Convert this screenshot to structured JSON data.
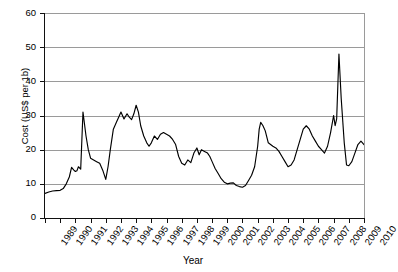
{
  "chart_data": {
    "type": "line",
    "title": "",
    "xlabel": "Year",
    "ylabel": "Cost (US$ per 1b)",
    "ylim": [
      0,
      60
    ],
    "xlim": [
      1989,
      2010
    ],
    "grid": "horizontal",
    "legend": "none",
    "ytick_labels": [
      "0",
      "10",
      "20",
      "30",
      "40",
      "50",
      "60"
    ],
    "ytick_values": [
      0,
      10,
      20,
      30,
      40,
      50,
      60
    ],
    "xtick_labels": [
      "1989",
      "1990",
      "1991",
      "1992",
      "1993",
      "1994",
      "1995",
      "1996",
      "1997",
      "1998",
      "1999",
      "2000",
      "2001",
      "2002",
      "2003",
      "2004",
      "2005",
      "2006",
      "2007",
      "2008",
      "2009",
      "2010"
    ],
    "xtick_values": [
      1989,
      1990,
      1991,
      1992,
      1993,
      1994,
      1995,
      1996,
      1997,
      1998,
      1999,
      2000,
      2001,
      2002,
      2003,
      2004,
      2005,
      2006,
      2007,
      2008,
      2009,
      2010
    ],
    "series": [
      {
        "name": "Cost",
        "color": "#000000",
        "x": [
          1989.0,
          1989.25,
          1989.5,
          1989.75,
          1990.0,
          1990.2,
          1990.4,
          1990.6,
          1990.75,
          1990.9,
          1991.0,
          1991.1,
          1991.2,
          1991.35,
          1991.5,
          1991.7,
          1991.85,
          1992.0,
          1992.2,
          1992.4,
          1992.6,
          1992.8,
          1993.0,
          1993.15,
          1993.3,
          1993.5,
          1993.7,
          1993.85,
          1994.0,
          1994.2,
          1994.4,
          1994.55,
          1994.7,
          1994.85,
          1995.0,
          1995.15,
          1995.3,
          1995.5,
          1995.7,
          1995.85,
          1996.0,
          1996.2,
          1996.4,
          1996.6,
          1996.8,
          1997.0,
          1997.2,
          1997.4,
          1997.6,
          1997.8,
          1998.0,
          1998.2,
          1998.4,
          1998.6,
          1998.8,
          1999.0,
          1999.15,
          1999.3,
          1999.5,
          1999.7,
          1999.85,
          2000.0,
          2000.2,
          2000.4,
          2000.6,
          2000.8,
          2001.0,
          2001.2,
          2001.4,
          2001.6,
          2001.8,
          2002.0,
          2002.2,
          2002.4,
          2002.6,
          2002.8,
          2003.0,
          2003.1,
          2003.2,
          2003.35,
          2003.5,
          2003.7,
          2003.85,
          2004.0,
          2004.2,
          2004.4,
          2004.6,
          2004.8,
          2005.0,
          2005.2,
          2005.4,
          2005.6,
          2005.8,
          2006.0,
          2006.2,
          2006.4,
          2006.6,
          2006.8,
          2007.0,
          2007.2,
          2007.4,
          2007.6,
          2007.8,
          2008.0,
          2008.1,
          2008.2,
          2008.35,
          2008.5,
          2008.7,
          2008.85,
          2009.0,
          2009.2,
          2009.4,
          2009.6,
          2009.8,
          2010.0
        ],
        "y": [
          7.2,
          7.6,
          7.9,
          8.0,
          8.1,
          8.6,
          10.0,
          12.0,
          14.8,
          14.0,
          13.6,
          13.8,
          15.0,
          14.3,
          31.0,
          24.0,
          20.0,
          17.5,
          17.0,
          16.5,
          16.0,
          14.0,
          11.3,
          15.0,
          20.0,
          26.0,
          28.0,
          29.5,
          31.0,
          29.0,
          30.5,
          29.5,
          28.8,
          30.5,
          33.0,
          31.0,
          27.0,
          24.0,
          22.0,
          21.0,
          22.0,
          24.0,
          23.0,
          24.5,
          25.0,
          24.5,
          24.0,
          23.0,
          21.5,
          18.0,
          16.0,
          15.5,
          17.0,
          16.2,
          19.0,
          20.5,
          18.5,
          20.0,
          19.5,
          19.0,
          18.0,
          16.5,
          14.5,
          13.0,
          11.5,
          10.5,
          10.0,
          10.2,
          10.3,
          9.5,
          9.2,
          9.0,
          9.5,
          11.0,
          12.5,
          15.0,
          21.0,
          26.0,
          28.0,
          27.0,
          25.5,
          22.0,
          21.5,
          21.0,
          20.5,
          19.5,
          18.0,
          16.5,
          15.0,
          15.5,
          17.0,
          20.0,
          23.0,
          26.0,
          27.0,
          26.0,
          24.0,
          22.5,
          21.0,
          20.0,
          19.0,
          21.0,
          25.0,
          30.0,
          27.0,
          29.0,
          48.0,
          35.0,
          22.0,
          15.5,
          15.3,
          16.5,
          19.0,
          21.5,
          22.5,
          21.5
        ]
      }
    ]
  }
}
